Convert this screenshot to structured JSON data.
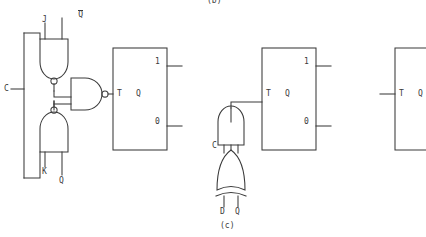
{
  "figure": {
    "kind": "logic-circuit-diagram",
    "stroke_color": "#3a3a3a",
    "text_color": "#3a3a3a",
    "background": "#ffffff",
    "caption_top": "(b)",
    "caption_middle": "(c)"
  },
  "circuit_b": {
    "name": "JK flip-flop from NAND gates driving T flip-flop",
    "inputs": {
      "j": "J",
      "qbar": "Q",
      "qbar_overline": true,
      "clock": "C",
      "k": "K",
      "q": "Q"
    },
    "gates": [
      {
        "id": "nand-top",
        "type": "nand",
        "inputs": [
          "J",
          "Qbar",
          "C"
        ],
        "orientation": "down"
      },
      {
        "id": "nand-mid",
        "type": "nand",
        "inputs": [
          "nand-top",
          "nand-bot"
        ],
        "orientation": "right"
      },
      {
        "id": "nand-bot",
        "type": "nand",
        "inputs": [
          "K",
          "Q",
          "C"
        ],
        "orientation": "up"
      }
    ],
    "flipflop": {
      "t_label": "T",
      "q_label": "Q",
      "out_high": "1",
      "out_low": "0"
    }
  },
  "circuit_c": {
    "name": "D flip-flop from AND and XOR gates driving T flip-flop",
    "inputs": {
      "clock": "C",
      "d": "D",
      "q": "Q"
    },
    "gates": [
      {
        "id": "and-1",
        "type": "and",
        "inputs": [
          "C",
          "xor-1"
        ],
        "orientation": "up"
      },
      {
        "id": "xor-1",
        "type": "xor",
        "inputs": [
          "D",
          "Q"
        ],
        "orientation": "up"
      }
    ],
    "flipflop": {
      "t_label": "T",
      "q_label": "Q",
      "out_high": "1",
      "out_low": "0"
    }
  },
  "circuit_right": {
    "name": "partially visible T flip-flop at right edge",
    "flipflop": {
      "t_label": "T",
      "q_label": "Q"
    }
  }
}
